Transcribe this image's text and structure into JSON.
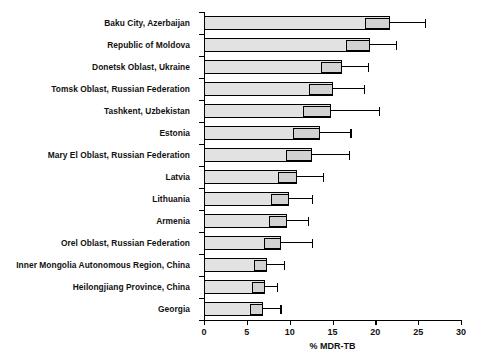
{
  "chart_data": {
    "type": "bar",
    "orientation": "horizontal",
    "title": "",
    "xlabel": "% MDR-TB",
    "ylabel": "",
    "xlim": [
      0,
      30
    ],
    "xticks": [
      0,
      5,
      10,
      15,
      20,
      25,
      30
    ],
    "xtick_labels": [
      "0",
      "5",
      "10",
      "15",
      "20",
      "25",
      "30"
    ],
    "grid": false,
    "legend": null,
    "categories": [
      "Baku City, Azerbaijan",
      "Republic of Moldova",
      "Donetsk Oblast, Ukraine",
      "Tomsk Oblast, Russian Federation",
      "Tashkent, Uzbekistan",
      "Estonia",
      "Mary El Oblast, Russian Federation",
      "Latvia",
      "Lithuania",
      "Armenia",
      "Orel Oblast, Russian Federation",
      "Inner Mongolia Autonomous Region, China",
      "Heilongjiang Province, China",
      "Georgia"
    ],
    "values": [
      21.7,
      19.4,
      16.1,
      15.1,
      14.8,
      13.5,
      12.6,
      10.9,
      9.9,
      9.7,
      9.0,
      7.4,
      7.1,
      6.9
    ],
    "ci_low": [
      18.8,
      16.6,
      13.6,
      12.2,
      11.6,
      10.4,
      9.6,
      8.6,
      7.8,
      7.6,
      7.0,
      5.8,
      5.6,
      5.4
    ],
    "ci_high": [
      25.8,
      22.4,
      19.1,
      18.7,
      20.4,
      17.1,
      16.9,
      13.9,
      12.6,
      12.1,
      12.6,
      9.3,
      8.5,
      8.9
    ],
    "series": [
      {
        "name": "% MDR-TB",
        "values": [
          21.7,
          19.4,
          16.1,
          15.1,
          14.8,
          13.5,
          12.6,
          10.9,
          9.9,
          9.7,
          9.0,
          7.4,
          7.1,
          6.9
        ]
      }
    ]
  }
}
